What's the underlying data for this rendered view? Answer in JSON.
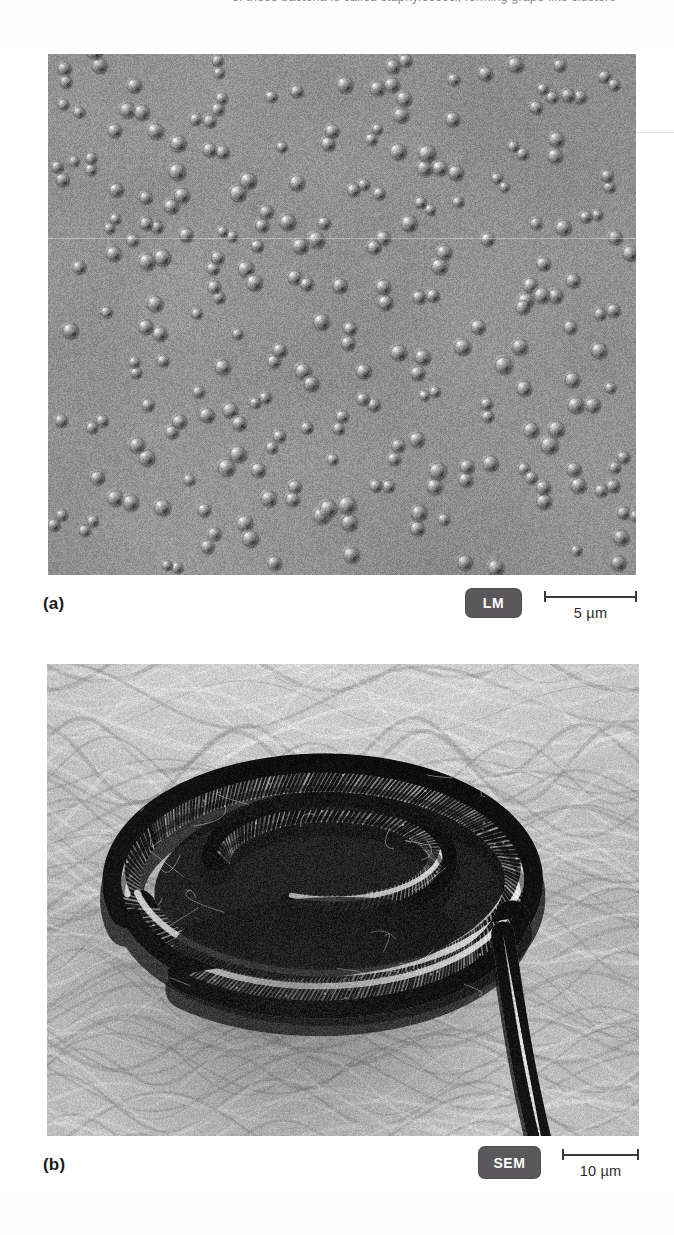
{
  "page": {
    "background_color": "#ffffff",
    "top_cropped_text": "of these bacteria is called staphylococci, forming grape-like clusters",
    "ink_color": "#231f20"
  },
  "figure": {
    "panels": [
      {
        "letter": "(a)",
        "technique_badge": "LM",
        "badge_color": "#5a585a",
        "badge_text_color": "#ffffff",
        "scale_bar_label": "5 µm",
        "scale_bar_value": 5,
        "scale_bar_unit": "µm",
        "subject": "spherical cocci bacteria arranged in pairs and small clusters",
        "image_kind": "light-micrograph",
        "tone": "grayscale",
        "seed": 1741
      },
      {
        "letter": "(b)",
        "technique_badge": "SEM",
        "badge_color": "#5a585a",
        "badge_text_color": "#ffffff",
        "scale_bar_label": "10 µm",
        "scale_bar_value": 10,
        "scale_bar_unit": "µm",
        "subject": "coiled helical spirochete bacterium resting on a rippled substrate",
        "image_kind": "scanning-electron-micrograph",
        "tone": "grayscale",
        "seed": 9302
      }
    ]
  }
}
